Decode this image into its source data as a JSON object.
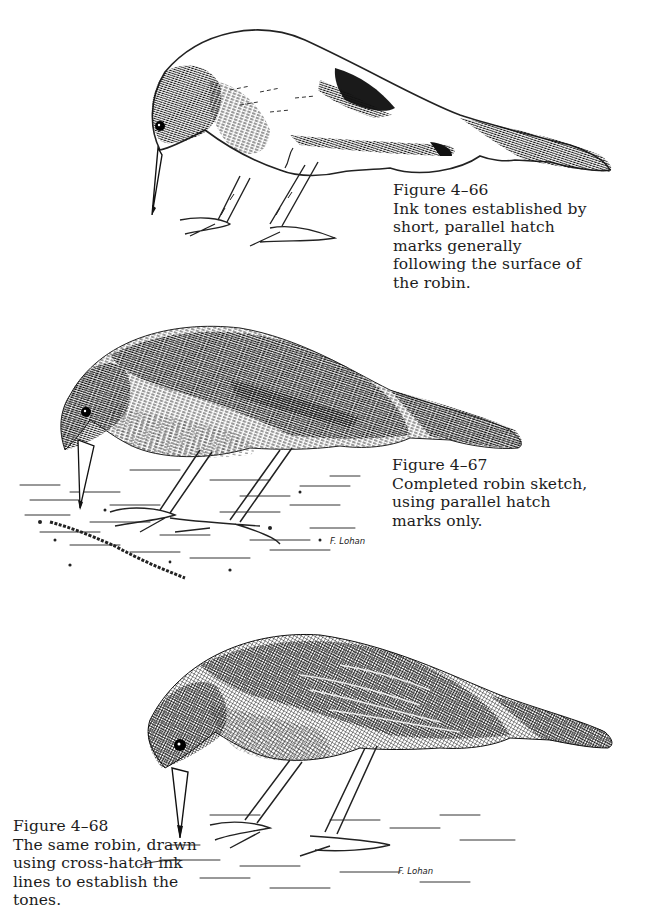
{
  "figures": [
    {
      "label": "Figure 4–66",
      "caption": "Ink tones established by short, parallel hatch marks generally following the surface of the robin.",
      "caption_lines": [
        "Ink tones established by",
        "short, parallel hatch",
        "marks generally",
        "following the surface of",
        "the robin."
      ],
      "technique": "partial parallel hatching"
    },
    {
      "label": "Figure 4–67",
      "caption": "Completed robin sketch, using parallel hatch marks only.",
      "caption_lines": [
        "Completed robin sketch,",
        "using parallel hatch",
        "marks only."
      ],
      "signature": "F. Lohan",
      "technique": "full parallel hatching"
    },
    {
      "label": "Figure 4–68",
      "caption": "The same robin, drawn using cross-hatch ink lines to establish the tones.",
      "caption_lines": [
        "The same robin, drawn",
        "using cross-hatch ink",
        "lines to establish the",
        "tones."
      ],
      "signature": "F. Lohan",
      "technique": "cross-hatching"
    }
  ],
  "colors": {
    "ink": "#1a1a1a",
    "paper": "#ffffff"
  }
}
